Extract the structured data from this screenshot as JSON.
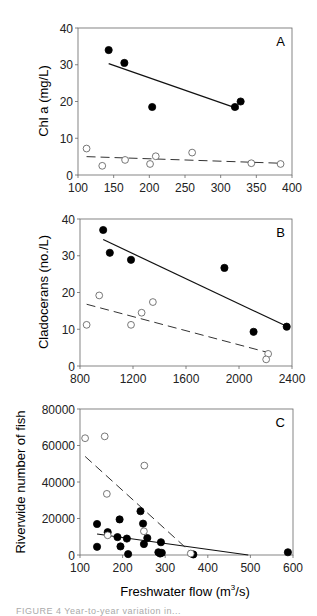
{
  "chart_data": [
    {
      "type": "scatter",
      "panel": "A",
      "xlabel": "",
      "ylabel": "Chl a (mg/L)",
      "xlim": [
        100,
        400
      ],
      "ylim": [
        0,
        40
      ],
      "xticks": [
        100,
        150,
        200,
        250,
        300,
        350,
        400
      ],
      "yticks": [
        0,
        10,
        20,
        30,
        40
      ],
      "grid": false,
      "series": [
        {
          "name": "filled",
          "marker": "filled-circle",
          "points": [
            [
              143,
              34
            ],
            [
              165,
              30.5
            ],
            [
              204,
              18.5
            ],
            [
              320,
              18.5
            ],
            [
              328,
              20
            ]
          ],
          "fit": {
            "style": "solid",
            "x": [
              143,
              325
            ],
            "y": [
              30.3,
              18.0
            ]
          }
        },
        {
          "name": "open",
          "marker": "open-circle",
          "points": [
            [
              112,
              7.2
            ],
            [
              134,
              2.5
            ],
            [
              166,
              4.1
            ],
            [
              201,
              3.0
            ],
            [
              209,
              5.1
            ],
            [
              260,
              6.1
            ],
            [
              343,
              3.2
            ],
            [
              384,
              3.0
            ]
          ],
          "fit": {
            "style": "dashed",
            "x": [
              112,
              384
            ],
            "y": [
              5.0,
              3.2
            ]
          }
        }
      ]
    },
    {
      "type": "scatter",
      "panel": "B",
      "xlabel": "",
      "ylabel": "Cladocerans (no./L)",
      "xlim": [
        800,
        2400
      ],
      "ylim": [
        0,
        40
      ],
      "xticks": [
        800,
        1200,
        1600,
        2000,
        2400
      ],
      "yticks": [
        0,
        10,
        20,
        30,
        40
      ],
      "grid": false,
      "series": [
        {
          "name": "filled",
          "marker": "filled-circle",
          "points": [
            [
              975,
              37
            ],
            [
              1025,
              30.8
            ],
            [
              1185,
              28.9
            ],
            [
              1890,
              26.7
            ],
            [
              2110,
              9.3
            ],
            [
              2360,
              10.7
            ]
          ],
          "fit": {
            "style": "solid",
            "x": [
              975,
              2360
            ],
            "y": [
              34.4,
              10.8
            ]
          }
        },
        {
          "name": "open",
          "marker": "open-circle",
          "points": [
            [
              850,
              11.2
            ],
            [
              945,
              19.2
            ],
            [
              1185,
              11.2
            ],
            [
              1265,
              14.5
            ],
            [
              1350,
              17.4
            ],
            [
              2220,
              3.3
            ],
            [
              2205,
              1.8
            ]
          ],
          "fit": {
            "style": "dashed",
            "x": [
              850,
              2205
            ],
            "y": [
              16.8,
              3.8
            ]
          }
        }
      ]
    },
    {
      "type": "scatter",
      "panel": "C",
      "xlabel": "Freshwater flow (m³/s)",
      "ylabel": "Riverwide number of fish",
      "xlim": [
        100,
        600
      ],
      "ylim": [
        0,
        80000
      ],
      "xticks": [
        100,
        200,
        300,
        400,
        500,
        600
      ],
      "yticks": [
        0,
        20000,
        40000,
        60000,
        80000
      ],
      "grid": false,
      "series": [
        {
          "name": "filled",
          "marker": "filled-circle",
          "points": [
            [
              140,
              17000
            ],
            [
              140,
              4500
            ],
            [
              165,
              12500
            ],
            [
              188,
              9800
            ],
            [
              193,
              19500
            ],
            [
              195,
              4700
            ],
            [
              210,
              9000
            ],
            [
              213,
              500
            ],
            [
              242,
              24000
            ],
            [
              248,
              17200
            ],
            [
              250,
              6000
            ],
            [
              258,
              9300
            ],
            [
              284,
              1500
            ],
            [
              288,
              800
            ],
            [
              290,
              7000
            ],
            [
              292,
              1200
            ],
            [
              366,
              300
            ],
            [
              588,
              1500
            ]
          ],
          "fit": {
            "style": "solid",
            "x": [
              140,
              495
            ],
            "y": [
              11500,
              0
            ]
          }
        },
        {
          "name": "open",
          "marker": "open-circle",
          "points": [
            [
              112,
              64000
            ],
            [
              158,
              65000
            ],
            [
              163,
              33500
            ],
            [
              165,
              10800
            ],
            [
              251,
              49000
            ],
            [
              250,
              13000
            ],
            [
              360,
              800
            ]
          ],
          "fit": {
            "style": "dashed",
            "x": [
              112,
              360
            ],
            "y": [
              54000,
              1500
            ]
          }
        }
      ]
    }
  ],
  "panels": {
    "A": {
      "letter": "A",
      "ylabel": "Chl a (mg/L)",
      "xticks": [
        "100",
        "150",
        "200",
        "250",
        "300",
        "350",
        "400"
      ],
      "yticks": [
        "0",
        "10",
        "20",
        "30",
        "40"
      ]
    },
    "B": {
      "letter": "B",
      "ylabel": "Cladocerans (no./L)",
      "xticks": [
        "800",
        "1200",
        "1600",
        "2000",
        "2400"
      ],
      "yticks": [
        "0",
        "10",
        "20",
        "30",
        "40"
      ]
    },
    "C": {
      "letter": "C",
      "ylabel": "Riverwide number of fish",
      "xlabel_main": "Freshwater flow (m",
      "xlabel_sup": "3",
      "xlabel_tail": "/s)",
      "xticks": [
        "100",
        "200",
        "300",
        "400",
        "500",
        "600"
      ],
      "yticks": [
        "0",
        "20000",
        "40000",
        "60000",
        "80000"
      ]
    }
  },
  "caption_fragment": "FIGURE 4  Year-to-year variation in..."
}
